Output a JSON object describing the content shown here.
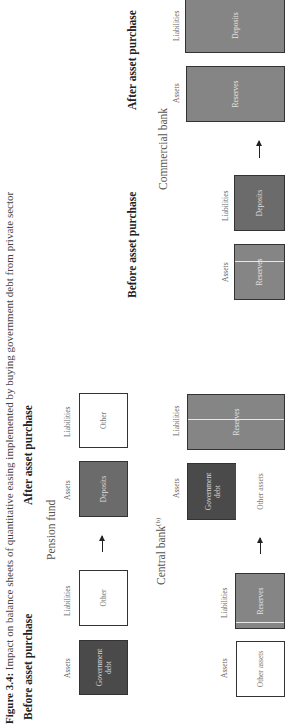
{
  "figure": {
    "title_prefix": "Figure 3.4:",
    "title_rest": " Impact on balance sheets of quantitative easing implemented by buying government debt from private sector"
  },
  "headers": {
    "before": "Before asset purchase",
    "after": "After asset purchase"
  },
  "column_labels": {
    "assets": "Assets",
    "liabilities": "Liabilities"
  },
  "pension_fund": {
    "label": "Pension fund",
    "before": {
      "assets": "Government debt",
      "liabilities": "Other"
    },
    "after": {
      "assets": "Deposits",
      "liabilities": "Other"
    }
  },
  "central_bank": {
    "label": "Central bank",
    "footnote": "(b)",
    "before": {
      "assets": "Other assets",
      "liabilities": "Reserves"
    },
    "after": {
      "assets_top": "Government debt",
      "assets_bottom": "Other assets",
      "liabilities": "Reserves"
    }
  },
  "commercial_bank": {
    "label": "Commercial bank",
    "before": {
      "assets": "Reserves",
      "liabilities": "Deposits"
    },
    "after": {
      "assets": "Reserves",
      "liabilities": "Deposits"
    }
  },
  "colors": {
    "government_debt": "#4a4a4a",
    "deposits": "#6b6b6b",
    "reserves": "#858585",
    "other": "#ffffff"
  }
}
